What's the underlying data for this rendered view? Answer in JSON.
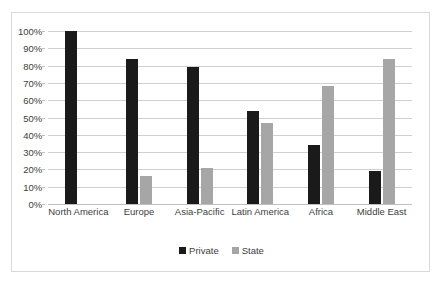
{
  "chart_data": {
    "type": "bar",
    "title": "",
    "subtitle": "",
    "xlabel": "",
    "ylabel": "",
    "ylim": [
      0,
      100
    ],
    "grid": true,
    "legend_position": "bottom",
    "categories": [
      "North America",
      "Europe",
      "Asia-Pacific",
      "Latin America",
      "Africa",
      "Middle East"
    ],
    "ytick_labels": [
      "0%",
      "10%",
      "20%",
      "30%",
      "40%",
      "50%",
      "60%",
      "70%",
      "80%",
      "90%",
      "100%"
    ],
    "ytick_values": [
      0,
      10,
      20,
      30,
      40,
      50,
      60,
      70,
      80,
      90,
      100
    ],
    "series": [
      {
        "name": "Private",
        "color": "#1a1a1a",
        "values": [
          100,
          84,
          79,
          54,
          34,
          19
        ]
      },
      {
        "name": "State",
        "color": "#a6a6a6",
        "values": [
          0,
          16,
          21,
          47,
          68,
          84
        ]
      }
    ]
  },
  "legend": {
    "items": [
      {
        "label": "Private",
        "color": "#1a1a1a"
      },
      {
        "label": "State",
        "color": "#a6a6a6"
      }
    ]
  }
}
